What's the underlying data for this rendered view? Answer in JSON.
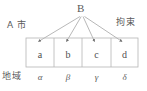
{
  "diagram": {
    "type": "tree-to-table",
    "root": {
      "label": "B",
      "x": 82,
      "y": 10
    },
    "side_labels": {
      "left_top": "A 市",
      "right_top": "拘束",
      "left_bottom": "地域"
    },
    "table": {
      "x": 26,
      "y": 38,
      "width": 112,
      "height": 29,
      "columns": 4,
      "cells": [
        {
          "label": "a",
          "region": "α",
          "x": 26,
          "width": 28
        },
        {
          "label": "b",
          "region": "β",
          "x": 54,
          "width": 28
        },
        {
          "label": "c",
          "region": "γ",
          "x": 82,
          "width": 29
        },
        {
          "label": "d",
          "region": "δ",
          "x": 111,
          "width": 27
        }
      ]
    },
    "edges": [
      {
        "from": "B",
        "to": "a",
        "x1": 80,
        "y1": 16,
        "x2": 38,
        "y2": 41
      },
      {
        "from": "B",
        "to": "b",
        "x1": 81,
        "y1": 16,
        "x2": 66,
        "y2": 41
      },
      {
        "from": "B",
        "to": "c",
        "x1": 82,
        "y1": 16,
        "x2": 94,
        "y2": 41
      },
      {
        "from": "B",
        "to": "d",
        "x1": 84,
        "y1": 16,
        "x2": 122,
        "y2": 41
      }
    ],
    "colors": {
      "stroke": "#9a9a9a",
      "border": "#b5b5b5",
      "text": "#4f4f4f",
      "background": "#ffffff"
    }
  }
}
